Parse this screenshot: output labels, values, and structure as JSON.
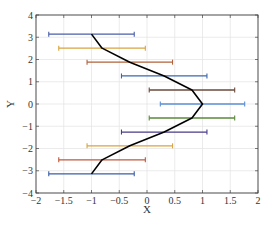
{
  "chart_data": {
    "type": "errorbar",
    "title": "",
    "xlabel": "X",
    "ylabel": "Y",
    "xlim": [
      -2,
      2
    ],
    "ylim": [
      -4,
      4
    ],
    "grid": true,
    "xticks": [
      -2,
      -1.5,
      -1,
      -0.5,
      0,
      0.5,
      1,
      1.5,
      2
    ],
    "xtick_labels": [
      "−2",
      "−1.5",
      "−1",
      "−0.5",
      "0",
      "0.5",
      "1",
      "1.5",
      "2"
    ],
    "yticks": [
      -4,
      -3,
      -2,
      -1,
      0,
      1,
      2,
      3,
      4
    ],
    "ytick_labels": [
      "−4",
      "−3",
      "−2",
      "−1",
      "0",
      "1",
      "2",
      "3",
      "4"
    ],
    "line": {
      "name": "x = cos(y)",
      "color": "#000000",
      "x": [
        -1.0,
        -0.81,
        -0.31,
        0.31,
        0.81,
        1.0,
        0.81,
        0.31,
        -0.31,
        -0.81,
        -1.0
      ],
      "y": [
        3.14,
        2.51,
        1.88,
        1.26,
        0.63,
        0,
        -0.63,
        -1.26,
        -1.88,
        -2.51,
        -3.14
      ]
    },
    "errorbars": [
      {
        "y": 3.14,
        "x": -1.0,
        "xerr": 0.77,
        "color": "#4a5ea8"
      },
      {
        "y": 2.51,
        "x": -0.81,
        "xerr": 0.78,
        "color": "#d9a441"
      },
      {
        "y": 1.88,
        "x": -0.31,
        "xerr": 0.77,
        "color": "#b0603a"
      },
      {
        "y": 1.26,
        "x": 0.31,
        "xerr": 0.77,
        "color": "#3a66b0"
      },
      {
        "y": 0.63,
        "x": 0.81,
        "xerr": 0.77,
        "color": "#6b4a3a"
      },
      {
        "y": 0,
        "x": 1.0,
        "xerr": 0.76,
        "color": "#5a8fd6"
      },
      {
        "y": -0.63,
        "x": 0.81,
        "xerr": 0.77,
        "color": "#5a8a3a"
      },
      {
        "y": -1.26,
        "x": 0.31,
        "xerr": 0.77,
        "color": "#4a3a8a"
      },
      {
        "y": -1.88,
        "x": -0.31,
        "xerr": 0.77,
        "color": "#d9a441"
      },
      {
        "y": -2.51,
        "x": -0.81,
        "xerr": 0.78,
        "color": "#c0583a"
      },
      {
        "y": -3.14,
        "x": -1.0,
        "xerr": 0.77,
        "color": "#3a5ea8"
      }
    ]
  }
}
